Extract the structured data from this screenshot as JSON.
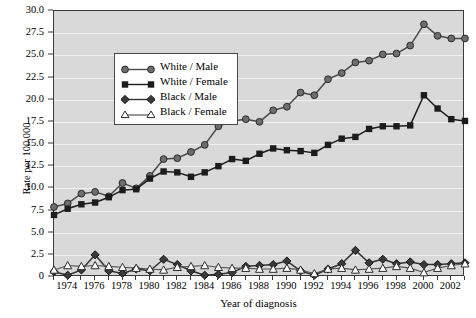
{
  "chart_data": {
    "type": "line",
    "title": "",
    "xlabel": "Year of diagnosis",
    "ylabel": "Rate per 100,000",
    "xlim": [
      1973,
      2003
    ],
    "ylim": [
      0,
      30
    ],
    "ytick_step": 2.5,
    "grid": "horizontal white gridlines on gray panel",
    "legend_position": "upper left inside plot",
    "x": [
      1973,
      1974,
      1975,
      1976,
      1977,
      1978,
      1979,
      1980,
      1981,
      1982,
      1983,
      1984,
      1985,
      1986,
      1987,
      1988,
      1989,
      1990,
      1991,
      1992,
      1993,
      1994,
      1995,
      1996,
      1997,
      1998,
      1999,
      2000,
      2001,
      2002,
      2003
    ],
    "xtick_labels": [
      "1974",
      "1976",
      "1978",
      "1980",
      "1982",
      "1984",
      "1986",
      "1988",
      "1990",
      "1992",
      "1994",
      "1996",
      "1998",
      "2000",
      "2002"
    ],
    "ytick_labels": [
      "0",
      "2.5",
      "5.0",
      "7.5",
      "10.0",
      "12.5",
      "15.0",
      "17.5",
      "20.0",
      "22.5",
      "25.0",
      "27.5",
      "30.0"
    ],
    "series": [
      {
        "name": "White / Male",
        "marker": "circle-filled",
        "color": "#4a4a4a",
        "values": [
          7.9,
          8.3,
          9.4,
          9.6,
          9.1,
          10.6,
          10.0,
          11.4,
          13.3,
          13.4,
          14.1,
          14.9,
          17.0,
          17.6,
          17.8,
          17.5,
          18.8,
          19.2,
          20.8,
          20.5,
          22.3,
          23.0,
          24.2,
          24.4,
          25.1,
          25.2,
          26.1,
          28.5,
          27.2,
          26.9,
          26.9
        ]
      },
      {
        "name": "White / Female",
        "marker": "square-filled",
        "color": "#1c1c1c",
        "values": [
          7.0,
          7.7,
          8.2,
          8.4,
          9.0,
          9.8,
          9.9,
          11.1,
          11.9,
          11.8,
          11.3,
          11.8,
          12.5,
          13.3,
          13.1,
          13.9,
          14.5,
          14.3,
          14.2,
          14.0,
          14.9,
          15.6,
          15.8,
          16.7,
          17.0,
          17.0,
          17.1,
          20.5,
          19.0,
          17.8,
          17.6
        ]
      },
      {
        "name": "Black / Male",
        "marker": "diamond-filled",
        "color": "#333333",
        "values": [
          0.6,
          0.2,
          0.8,
          2.5,
          0.7,
          0.4,
          0.9,
          0.7,
          2.0,
          1.4,
          0.7,
          0.2,
          0.3,
          0.5,
          1.2,
          1.3,
          1.4,
          1.8,
          0.7,
          0.2,
          0.9,
          1.5,
          3.0,
          1.6,
          2.0,
          1.5,
          1.7,
          1.4,
          1.4,
          1.5,
          1.6
        ]
      },
      {
        "name": "Black / Female",
        "marker": "triangle-open",
        "color": "#555555",
        "values": [
          0.8,
          1.3,
          1.2,
          1.3,
          1.2,
          1.1,
          1.0,
          0.9,
          0.8,
          1.1,
          1.2,
          1.3,
          1.1,
          1.0,
          1.0,
          0.9,
          0.9,
          1.0,
          0.8,
          0.4,
          0.9,
          1.0,
          0.8,
          0.9,
          1.0,
          1.2,
          1.0,
          0.5,
          1.0,
          1.3,
          1.5
        ]
      }
    ]
  },
  "legend": {
    "items": [
      {
        "label": "White / Male"
      },
      {
        "label": "White / Female"
      },
      {
        "label": "Black / Male"
      },
      {
        "label": "Black / Female"
      }
    ]
  },
  "axes": {
    "y_title": "Rate per 100,000",
    "x_title": "Year of diagnosis"
  }
}
